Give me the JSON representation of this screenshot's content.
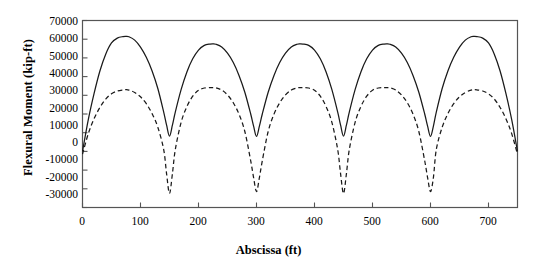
{
  "chart_data": {
    "type": "line",
    "title": "",
    "xlabel": "Abscissa (ft)",
    "ylabel": "Flexural Moment (kip-ft)",
    "xlim": [
      0,
      750
    ],
    "ylim": [
      -30000,
      70000
    ],
    "xticks": [
      0,
      100,
      200,
      300,
      400,
      500,
      600,
      700
    ],
    "yticks": [
      -30000,
      -20000,
      -10000,
      0,
      10000,
      20000,
      30000,
      40000,
      50000,
      60000,
      70000
    ],
    "grid": false,
    "legend": "none",
    "span_length_ft": 150,
    "num_spans": 5,
    "series": [
      {
        "name": "positive-moment-envelope",
        "style": "solid",
        "color": "#1a1a1a",
        "x": [
          0,
          10,
          20,
          30,
          40,
          50,
          60,
          70,
          75,
          80,
          90,
          100,
          110,
          120,
          130,
          140,
          145,
          150,
          155,
          160,
          170,
          180,
          190,
          200,
          210,
          220,
          225,
          230,
          240,
          250,
          260,
          270,
          280,
          290,
          295,
          300,
          305,
          310,
          320,
          330,
          340,
          350,
          360,
          370,
          375,
          380,
          390,
          400,
          410,
          420,
          430,
          440,
          445,
          450,
          455,
          460,
          470,
          480,
          490,
          500,
          510,
          520,
          525,
          530,
          540,
          550,
          560,
          570,
          580,
          590,
          595,
          600,
          605,
          610,
          620,
          630,
          640,
          650,
          660,
          670,
          675,
          680,
          690,
          700,
          710,
          720,
          730,
          740,
          750
        ],
        "y": [
          0,
          17000,
          31000,
          43000,
          52000,
          58000,
          60600,
          61400,
          61500,
          61300,
          59500,
          55800,
          50300,
          43000,
          33500,
          21000,
          14000,
          8200,
          14000,
          21000,
          33000,
          42500,
          49500,
          54200,
          56700,
          57400,
          57500,
          57300,
          55800,
          52500,
          47500,
          40500,
          31500,
          20000,
          13500,
          8000,
          13500,
          20000,
          31500,
          40500,
          47500,
          52500,
          55800,
          57300,
          57500,
          57400,
          56700,
          54200,
          49500,
          42500,
          33000,
          21000,
          14000,
          8200,
          14000,
          21000,
          33000,
          42500,
          49500,
          54200,
          56700,
          57400,
          57500,
          57300,
          55800,
          52500,
          47500,
          40500,
          31500,
          20000,
          13500,
          8000,
          13500,
          21000,
          33500,
          43000,
          50300,
          55800,
          59500,
          61300,
          61500,
          61400,
          60600,
          58000,
          52000,
          43000,
          31000,
          17000,
          0
        ]
      },
      {
        "name": "negative-moment-envelope",
        "style": "dashed",
        "color": "#1a1a1a",
        "x": [
          0,
          10,
          20,
          30,
          40,
          50,
          60,
          70,
          75,
          80,
          90,
          100,
          110,
          120,
          130,
          140,
          145,
          150,
          155,
          160,
          170,
          180,
          190,
          200,
          210,
          220,
          225,
          230,
          240,
          250,
          260,
          270,
          280,
          290,
          295,
          300,
          305,
          310,
          320,
          330,
          340,
          350,
          360,
          370,
          375,
          380,
          390,
          400,
          410,
          420,
          430,
          440,
          445,
          450,
          455,
          460,
          470,
          480,
          490,
          500,
          510,
          520,
          525,
          530,
          540,
          550,
          560,
          570,
          580,
          590,
          595,
          600,
          605,
          610,
          620,
          630,
          640,
          650,
          660,
          670,
          675,
          680,
          690,
          700,
          710,
          720,
          730,
          740,
          750
        ],
        "y": [
          -1500,
          9500,
          17500,
          23500,
          28000,
          30800,
          32300,
          32900,
          33000,
          32800,
          31500,
          29200,
          25500,
          20200,
          12800,
          1000,
          -12000,
          -22500,
          -12000,
          1000,
          15500,
          24000,
          29500,
          32700,
          33900,
          34100,
          34100,
          34000,
          32800,
          30200,
          26000,
          19800,
          10500,
          -5000,
          -14000,
          -21500,
          -14000,
          -5000,
          10500,
          19800,
          26000,
          30200,
          32800,
          34000,
          34100,
          34100,
          33900,
          32700,
          29500,
          24000,
          15500,
          1000,
          -12000,
          -22500,
          -12000,
          1000,
          15500,
          24000,
          29500,
          32700,
          33900,
          34100,
          34100,
          34000,
          32800,
          30200,
          26000,
          19800,
          10500,
          -5000,
          -14000,
          -21500,
          -14000,
          1000,
          12800,
          20200,
          25500,
          29200,
          31500,
          32800,
          33000,
          32900,
          32300,
          30800,
          28000,
          23500,
          17500,
          9500,
          -1500
        ]
      }
    ]
  },
  "axes": {
    "ylabel": "Flexural Moment (kip-ft)",
    "xlabel": "Abscissa (ft)",
    "ytick_labels": [
      "70000",
      "60000",
      "50000",
      "40000",
      "30000",
      "20000",
      "10000",
      "0",
      "-10000",
      "-20000",
      "-30000"
    ],
    "xtick_labels": [
      "0",
      "100",
      "200",
      "300",
      "400",
      "500",
      "600",
      "700"
    ],
    "frame_color": "#555555",
    "line_color": "#1a1a1a"
  }
}
